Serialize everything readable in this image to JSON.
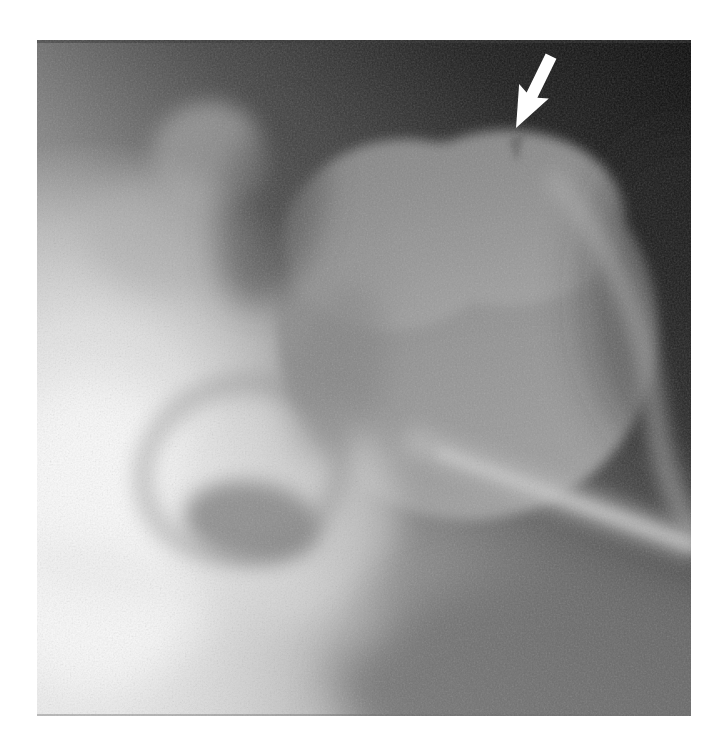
{
  "figure": {
    "page_background": "#ffffff",
    "image_region": {
      "left": 37,
      "top": 40,
      "width": 654,
      "height": 676
    },
    "palette": {
      "background_dark": "#0a0a0a",
      "midtone_gray": "#8f8f8f",
      "bone_bright": "#f2f2f2",
      "margin_white": "#ffffff"
    },
    "annotation": {
      "shape": "arrow",
      "color": "#ffffff",
      "direction": "pointing down-left",
      "transform": "translate(479,88) rotate(26)",
      "tip_x": 516,
      "tip_y": 129
    }
  }
}
